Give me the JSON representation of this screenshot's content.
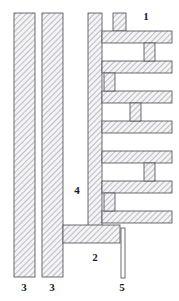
{
  "figure": {
    "type": "patent-cross-section-drawing",
    "title": "",
    "background_color": "#ffffff",
    "line_color": "#4a4a52",
    "hatch_color": "#8d8d98",
    "fill_color": "#f2f2f4",
    "label_color": "#1b1b1f",
    "canvas": {
      "width": 179,
      "height": 301
    }
  },
  "reference_labels": [
    {
      "id": "label-1",
      "text": "1",
      "x": 146,
      "y": 17,
      "refers_to": "top-tab"
    },
    {
      "id": "label-2",
      "text": "2",
      "x": 95,
      "y": 258,
      "refers_to": "base-plate"
    },
    {
      "id": "label-3a",
      "text": "3",
      "x": 24,
      "y": 288,
      "refers_to": "left-plate-outer"
    },
    {
      "id": "label-3b",
      "text": "3",
      "x": 52,
      "y": 288,
      "refers_to": "left-plate-inner"
    },
    {
      "id": "label-4",
      "text": "4",
      "x": 77,
      "y": 191,
      "refers_to": "vertical-spine"
    },
    {
      "id": "label-5",
      "text": "5",
      "x": 122,
      "y": 288,
      "refers_to": "pin"
    }
  ],
  "parts": {
    "left_plate_outer": {
      "name": "3",
      "x": 14,
      "y": 13,
      "width": 21,
      "height": 264,
      "hatched": true
    },
    "left_plate_inner": {
      "name": "3",
      "x": 42,
      "y": 13,
      "width": 21,
      "height": 264,
      "hatched": true
    },
    "vertical_spine": {
      "name": "4",
      "x": 88,
      "y": 13,
      "width": 14,
      "height": 226,
      "hatched": true
    },
    "base_plate": {
      "name": "2",
      "x": 63,
      "y": 225,
      "width": 57,
      "height": 18,
      "hatched": true
    },
    "top_tab": {
      "name": "1",
      "x": 113,
      "y": 13,
      "width": 13,
      "height": 18,
      "hatched": true
    },
    "pin": {
      "name": "5",
      "x": 121,
      "y": 228,
      "width": 4,
      "height": 50,
      "hatched": false
    }
  },
  "fins": [
    {
      "index": 1,
      "x": 102,
      "y": 31,
      "width": 70,
      "height": 12,
      "length": "long",
      "hatched": true
    },
    {
      "index": 2,
      "x": 102,
      "y": 61,
      "width": 70,
      "height": 12,
      "length": "long",
      "hatched": true
    },
    {
      "index": 3,
      "x": 102,
      "y": 91,
      "width": 70,
      "height": 12,
      "length": "long",
      "hatched": true
    },
    {
      "index": 4,
      "x": 102,
      "y": 121,
      "width": 70,
      "height": 12,
      "length": "long",
      "hatched": true
    },
    {
      "index": 5,
      "x": 102,
      "y": 151,
      "width": 70,
      "height": 12,
      "length": "long",
      "hatched": true
    },
    {
      "index": 6,
      "x": 102,
      "y": 181,
      "width": 70,
      "height": 12,
      "length": "long",
      "hatched": true
    },
    {
      "index": 7,
      "x": 102,
      "y": 211,
      "width": 70,
      "height": 12,
      "length": "long",
      "hatched": true
    }
  ],
  "connectors": [
    {
      "index": 1,
      "x": 144,
      "y": 43,
      "width": 11,
      "height": 18,
      "orientation": "vertical",
      "hatched": true
    },
    {
      "index": 2,
      "x": 104,
      "y": 73,
      "width": 11,
      "height": 18,
      "orientation": "vertical",
      "hatched": true
    },
    {
      "index": 3,
      "x": 130,
      "y": 103,
      "width": 11,
      "height": 18,
      "orientation": "vertical",
      "hatched": true
    },
    {
      "index": 4,
      "x": 144,
      "y": 163,
      "width": 11,
      "height": 18,
      "orientation": "vertical",
      "hatched": true
    },
    {
      "index": 5,
      "x": 104,
      "y": 193,
      "width": 11,
      "height": 18,
      "orientation": "vertical",
      "hatched": true
    }
  ]
}
